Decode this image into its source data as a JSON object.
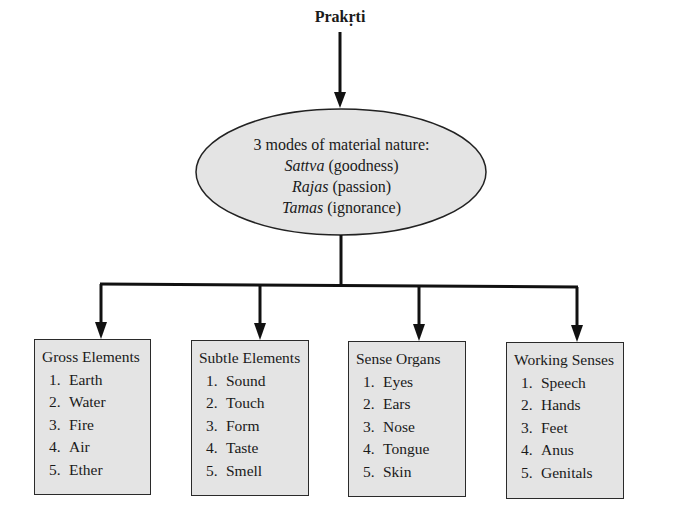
{
  "root": {
    "label": "Prakṛti"
  },
  "modes": {
    "title": "3 modes of material nature:",
    "items": [
      {
        "name": "Sattva",
        "meaning": "(goodness)"
      },
      {
        "name": "Rajas",
        "meaning": "(passion)"
      },
      {
        "name": "Tamas",
        "meaning": "(ignorance)"
      }
    ]
  },
  "categories": [
    {
      "title": "Gross Elements",
      "items": [
        {
          "num": "1.",
          "label": "Earth"
        },
        {
          "num": "2.",
          "label": "Water"
        },
        {
          "num": "3.",
          "label": "Fire"
        },
        {
          "num": "4.",
          "label": "Air"
        },
        {
          "num": "5.",
          "label": "Ether"
        }
      ]
    },
    {
      "title": "Subtle Elements",
      "items": [
        {
          "num": "1.",
          "label": "Sound"
        },
        {
          "num": "2.",
          "label": "Touch"
        },
        {
          "num": "3.",
          "label": "Form"
        },
        {
          "num": "4.",
          "label": "Taste"
        },
        {
          "num": "5.",
          "label": "Smell"
        }
      ]
    },
    {
      "title": "Sense Organs",
      "items": [
        {
          "num": "1.",
          "label": "Eyes"
        },
        {
          "num": "2.",
          "label": "Ears"
        },
        {
          "num": "3.",
          "label": "Nose"
        },
        {
          "num": "4.",
          "label": "Tongue"
        },
        {
          "num": "5.",
          "label": "Skin"
        }
      ]
    },
    {
      "title": "Working Senses",
      "items": [
        {
          "num": "1.",
          "label": "Speech"
        },
        {
          "num": "2.",
          "label": "Hands"
        },
        {
          "num": "3.",
          "label": "Feet"
        },
        {
          "num": "4.",
          "label": "Anus"
        },
        {
          "num": "5.",
          "label": "Genitals"
        }
      ]
    }
  ],
  "colors": {
    "node_fill": "#e4e4e4",
    "stroke": "#1a1a1a"
  }
}
